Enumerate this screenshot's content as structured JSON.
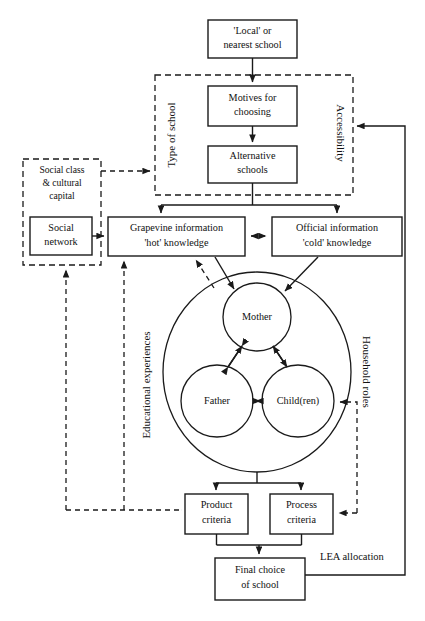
{
  "diagram": {
    "colors": {
      "stroke": "#1a1a1a",
      "text": "#111111",
      "background": "#ffffff"
    },
    "boxes": {
      "local_school": {
        "line1": "'Local' or",
        "line2": "nearest school"
      },
      "motives": {
        "line1": "Motives for",
        "line2": "choosing"
      },
      "alternative": {
        "line1": "Alternative",
        "line2": "schools"
      },
      "social_network": {
        "line1": "Social",
        "line2": "network"
      },
      "grapevine": {
        "line1": "Grapevine information",
        "line2": "'hot' knowledge"
      },
      "official": {
        "line1": "Official information",
        "line2": "'cold' knowledge"
      },
      "product_criteria": {
        "line1": "Product",
        "line2": "criteria"
      },
      "process_criteria": {
        "line1": "Process",
        "line2": "criteria"
      },
      "final_choice": {
        "line1": "Final choice",
        "line2": "of school"
      }
    },
    "dashed_groups": {
      "school_frame": {
        "left_label": "Type of school",
        "right_label": "Accessibility"
      },
      "social_class": {
        "line1": "Social class",
        "line2": "& cultural",
        "line3": "capital"
      }
    },
    "circles": {
      "household": {
        "label": ""
      },
      "mother": {
        "label": "Mother"
      },
      "father": {
        "label": "Father"
      },
      "children": {
        "label": "Child(ren)"
      }
    },
    "side_labels": {
      "educational_experiences": "Educational experiences",
      "household_roles": "Household roles"
    },
    "free_labels": {
      "lea_allocation": "LEA allocation"
    }
  }
}
